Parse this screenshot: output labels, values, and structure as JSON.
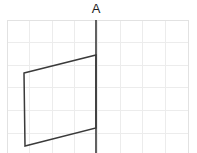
{
  "figure": {
    "type": "geometry-grid-figure",
    "background_color": "#ffffff",
    "label": {
      "text": "A",
      "name": "mirror-line-label",
      "color": "#1d1d1d",
      "x": 96,
      "y": 13,
      "font_size": 13
    },
    "grid": {
      "name": "background-grid",
      "line_color": "#ececec",
      "border_color": "#e2e2e2",
      "left": 7,
      "top": 20,
      "right": 188,
      "bottom": 153,
      "cell_size": 22.6,
      "vertical_line_xs": [
        7,
        29.6,
        52.2,
        74.8,
        97.4,
        120,
        142.6,
        165.2,
        188
      ],
      "horizontal_line_ys": [
        20,
        42.6,
        65.2,
        87.8,
        110.4,
        133,
        153
      ]
    },
    "mirror_line": {
      "name": "line-of-reflection",
      "color": "#3a3a3a",
      "stroke_width": 1.6,
      "x1": 96,
      "y1": 20,
      "x2": 96,
      "y2": 153
    },
    "shape": {
      "name": "parallelogram",
      "color": "#3a3a3a",
      "stroke_width": 1.5,
      "fill": "none",
      "vertices": [
        {
          "label": "top-left",
          "x": 24,
          "y": 73
        },
        {
          "label": "top-right",
          "x": 96,
          "y": 55
        },
        {
          "label": "bottom-right",
          "x": 96,
          "y": 128
        },
        {
          "label": "bottom-left",
          "x": 25,
          "y": 146
        }
      ],
      "points_string": "24,73 96,55 96,128 25,146"
    }
  }
}
